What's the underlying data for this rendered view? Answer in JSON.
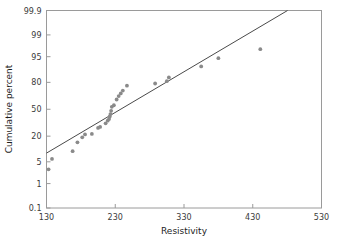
{
  "chart_data": {
    "type": "scatter",
    "title": "",
    "xlabel": "Resistivity",
    "ylabel": "Cumulative percent",
    "xlim": [
      130,
      530
    ],
    "ylim": [
      0.1,
      99.9
    ],
    "yscale": "normal-probability",
    "grid": false,
    "legend": null,
    "xticks": [
      130,
      230,
      330,
      430,
      530
    ],
    "xtick_labels": [
      "130",
      "230",
      "330",
      "430",
      "530"
    ],
    "yticks": [
      0.1,
      1,
      5,
      20,
      50,
      80,
      95,
      99,
      99.9
    ],
    "ytick_labels": [
      "0.1",
      "1",
      "5",
      "20",
      "50",
      "80",
      "95",
      "99",
      "99.9"
    ],
    "point_color": "#8a8a8a",
    "line_color": "#4a4a4a",
    "frame_color": "#9a9a9a",
    "series": [
      {
        "name": "resistivity-sample",
        "marker": "circle",
        "points": [
          {
            "x": 133,
            "y": 3.0
          },
          {
            "x": 138,
            "y": 6.0
          },
          {
            "x": 168,
            "y": 9.5
          },
          {
            "x": 175,
            "y": 15.0
          },
          {
            "x": 182,
            "y": 19.0
          },
          {
            "x": 186,
            "y": 21.5
          },
          {
            "x": 196,
            "y": 22.0
          },
          {
            "x": 205,
            "y": 28.0
          },
          {
            "x": 208,
            "y": 29.0
          },
          {
            "x": 216,
            "y": 33.0
          },
          {
            "x": 219,
            "y": 36.0
          },
          {
            "x": 221,
            "y": 38.0
          },
          {
            "x": 222,
            "y": 41.0
          },
          {
            "x": 223,
            "y": 44.0
          },
          {
            "x": 224,
            "y": 48.0
          },
          {
            "x": 225,
            "y": 53.0
          },
          {
            "x": 228,
            "y": 55.0
          },
          {
            "x": 232,
            "y": 62.0
          },
          {
            "x": 235,
            "y": 66.0
          },
          {
            "x": 238,
            "y": 69.0
          },
          {
            "x": 241,
            "y": 72.0
          },
          {
            "x": 247,
            "y": 77.0
          },
          {
            "x": 288,
            "y": 79.0
          },
          {
            "x": 305,
            "y": 81.0
          },
          {
            "x": 308,
            "y": 84.0
          },
          {
            "x": 355,
            "y": 91.0
          },
          {
            "x": 380,
            "y": 94.5
          },
          {
            "x": 441,
            "y": 97.0
          }
        ]
      }
    ],
    "fit_line": {
      "name": "normal-reference-line",
      "x1": 130,
      "y1": 8.5,
      "x2": 530,
      "y2": 99.99
    }
  }
}
